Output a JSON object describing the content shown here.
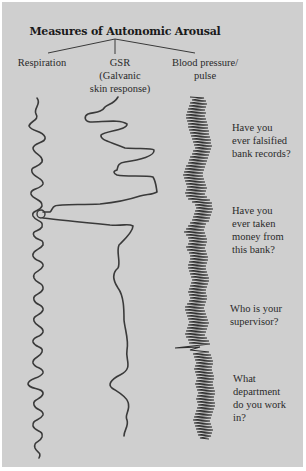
{
  "title": "Measures of Autonomic Arousal",
  "columns": [
    {
      "label": "Respiration"
    },
    {
      "label": "GSR\n(Galvanic\nskin response)"
    },
    {
      "label": "Blood pressure/\npulse"
    }
  ],
  "questions": [
    {
      "text": "Have you\never falsified\nbank records?"
    },
    {
      "text": "Have you\never taken\nmoney from\nthis bank?"
    },
    {
      "text": "Who is your\nsupervisor?"
    },
    {
      "text": "What\ndepartment\ndo you work\nin?"
    }
  ],
  "colors": {
    "background": "#cfcfcf",
    "trace": "#3a3a3a",
    "text": "#2a2a2a"
  }
}
